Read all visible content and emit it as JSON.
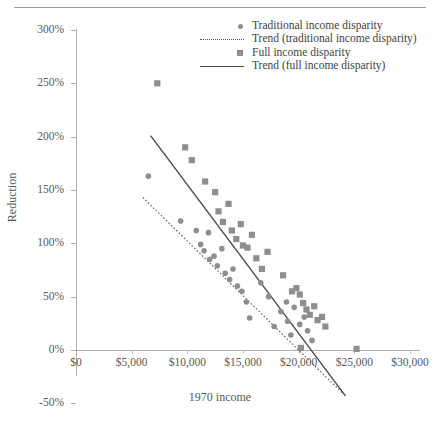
{
  "chart_data": {
    "type": "scatter",
    "title": "",
    "xlabel": "1970 income",
    "ylabel": "Reduction",
    "xlim": [
      0,
      31000
    ],
    "ylim": [
      -50,
      300
    ],
    "grid": false,
    "legend_position": "top-right",
    "x_ticks": [
      {
        "value": 0,
        "label": "$0"
      },
      {
        "value": 5000,
        "label": "$5,000"
      },
      {
        "value": 10000,
        "label": "$10,000"
      },
      {
        "value": 15000,
        "label": "$15,000"
      },
      {
        "value": 20000,
        "label": "$20,000"
      },
      {
        "value": 25000,
        "label": "$25,000"
      },
      {
        "value": 30000,
        "label": "$30,000"
      }
    ],
    "y_ticks": [
      {
        "value": 300,
        "label": "300%"
      },
      {
        "value": 250,
        "label": "250%"
      },
      {
        "value": 200,
        "label": "200%"
      },
      {
        "value": 150,
        "label": "150%"
      },
      {
        "value": 100,
        "label": "100%"
      },
      {
        "value": 50,
        "label": "50%"
      },
      {
        "value": 0,
        "label": "0%"
      },
      {
        "value": -50,
        "label": "-50%"
      }
    ],
    "series": [
      {
        "name": "Traditional income disparity",
        "marker": "circle",
        "color": "#8e8e90",
        "points": [
          [
            6500,
            163
          ],
          [
            9400,
            121
          ],
          [
            10800,
            112
          ],
          [
            11200,
            99
          ],
          [
            11500,
            93
          ],
          [
            11900,
            110
          ],
          [
            12000,
            85
          ],
          [
            12400,
            88
          ],
          [
            12700,
            79
          ],
          [
            13100,
            95
          ],
          [
            13400,
            72
          ],
          [
            13800,
            66
          ],
          [
            14100,
            76
          ],
          [
            14500,
            60
          ],
          [
            14900,
            55
          ],
          [
            15300,
            45
          ],
          [
            15600,
            30
          ],
          [
            16600,
            63
          ],
          [
            17300,
            50
          ],
          [
            17800,
            22
          ],
          [
            18400,
            36
          ],
          [
            18900,
            45
          ],
          [
            19000,
            27
          ],
          [
            19300,
            14
          ],
          [
            19600,
            40
          ],
          [
            20100,
            24
          ],
          [
            20500,
            31
          ],
          [
            20800,
            18
          ],
          [
            21200,
            9
          ]
        ]
      },
      {
        "name": "Full income disparity",
        "marker": "square",
        "color": "#8e8e90",
        "points": [
          [
            7300,
            250
          ],
          [
            9800,
            190
          ],
          [
            10400,
            178
          ],
          [
            11600,
            158
          ],
          [
            12500,
            148
          ],
          [
            12800,
            130
          ],
          [
            13200,
            120
          ],
          [
            13700,
            137
          ],
          [
            14000,
            112
          ],
          [
            14400,
            104
          ],
          [
            14800,
            118
          ],
          [
            15000,
            98
          ],
          [
            15400,
            96
          ],
          [
            15800,
            108
          ],
          [
            16200,
            86
          ],
          [
            16700,
            76
          ],
          [
            17200,
            92
          ],
          [
            18600,
            70
          ],
          [
            19400,
            55
          ],
          [
            19800,
            58
          ],
          [
            20100,
            52
          ],
          [
            20400,
            44
          ],
          [
            20700,
            38
          ],
          [
            21000,
            33
          ],
          [
            21400,
            41
          ],
          [
            21700,
            28
          ],
          [
            22100,
            31
          ],
          [
            22400,
            22
          ],
          [
            20200,
            2
          ],
          [
            25200,
            1
          ]
        ]
      }
    ],
    "trend_lines": [
      {
        "name": "Trend (traditional income disparity)",
        "style": "dotted",
        "color": "#5a5a5c",
        "from": [
          6000,
          143
        ],
        "to": [
          23900,
          -40
        ]
      },
      {
        "name": "Trend (full income disparity)",
        "style": "solid",
        "color": "#4a4a4c",
        "from": [
          6700,
          201
        ],
        "to": [
          24200,
          -43
        ]
      }
    ]
  },
  "legend": {
    "items": [
      {
        "label": "Traditional income disparity",
        "key": "marker-circle"
      },
      {
        "label": "Trend (traditional income disparity)",
        "key": "line-dotted"
      },
      {
        "label": "Full income disparity",
        "key": "marker-square"
      },
      {
        "label": "Trend (full income disparity)",
        "key": "line-solid"
      }
    ]
  },
  "axes": {
    "y_title": "Reduction",
    "x_title": "1970 income"
  },
  "colors": {
    "marker": "#8e8e90",
    "axis": "#b0b0b2",
    "text": "#58585a",
    "trend_solid": "#4a4a4c",
    "trend_dotted": "#5a5a5c"
  }
}
